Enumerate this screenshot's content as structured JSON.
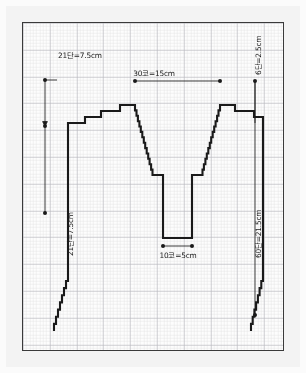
{
  "document": {
    "title": "뜨개 도안 (V넥 앞판 제도)",
    "type": "knitting-chart-schematic",
    "background_color": "#f3f3f3",
    "plate_color": "#fdfdfd",
    "line_color": "#1a1a1a",
    "grid_minor_color": "#e2e2e4",
    "grid_major_color": "#b9b9bf"
  },
  "labels": {
    "top_left": "21단=7.5cm",
    "top_center": "30코=15cm",
    "right_top": "6단=2.5cm",
    "right_main": "60단=21.5cm",
    "left_main": "21단=7.5cm",
    "bottom_center": "10코=5cm"
  },
  "chart_data": {
    "type": "table",
    "xlabel": "코 (stitches)",
    "ylabel": "단 (rows)",
    "grid": true,
    "legend": "none",
    "gauge": {
      "stitches_per_cm": 2,
      "rows_per_cm": 2.8
    },
    "dimensions": [
      {
        "name": "neck-width",
        "label": "30코=15cm",
        "stitches": 30,
        "cm": 15,
        "orientation": "horizontal",
        "position": "top-center"
      },
      {
        "name": "neck-base-width",
        "label": "10코=5cm",
        "stitches": 10,
        "cm": 5,
        "orientation": "horizontal",
        "position": "bottom-center"
      },
      {
        "name": "shoulder-slope-depth",
        "label": "21단=7.5cm",
        "rows": 21,
        "cm": 7.5,
        "orientation": "vertical",
        "position": "top-left"
      },
      {
        "name": "armhole-depth",
        "label": "21단=7.5cm",
        "rows": 21,
        "cm": 7.5,
        "orientation": "vertical",
        "position": "left"
      },
      {
        "name": "shoulder-step-depth",
        "label": "6단=2.5cm",
        "rows": 6,
        "cm": 2.5,
        "orientation": "vertical",
        "position": "right-top"
      },
      {
        "name": "total-body-length",
        "label": "60단=21.5cm",
        "rows": 60,
        "cm": 21.5,
        "orientation": "vertical",
        "position": "right"
      }
    ],
    "categories": [
      "30코=15cm",
      "10코=5cm",
      "21단=7.5cm",
      "21단=7.5cm",
      "6단=2.5cm",
      "60단=21.5cm"
    ],
    "values": [
      15,
      5,
      7.5,
      7.5,
      2.5,
      21.5
    ]
  }
}
